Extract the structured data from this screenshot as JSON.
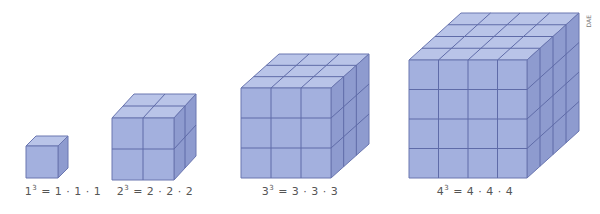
{
  "figure": {
    "credit": "DAE",
    "colors": {
      "front": "#a3b0de",
      "top": "#b9c4e8",
      "side": "#8e9bcf",
      "grid": "#5f6ba8",
      "edge": "#6a76b0"
    },
    "cubes": [
      {
        "n": 1,
        "base": "1",
        "factors": "1 · 1 · 1",
        "x": 26,
        "y": 146,
        "size": 32,
        "dx": 10,
        "dy": 10,
        "label_x": 63
      },
      {
        "n": 2,
        "base": "2",
        "factors": "2 · 2 · 2",
        "x": 112,
        "y": 118,
        "size": 62,
        "dx": 22,
        "dy": 24,
        "label_x": 155
      },
      {
        "n": 3,
        "base": "3",
        "factors": "3 · 3 · 3",
        "x": 241,
        "y": 88,
        "size": 90,
        "dx": 38,
        "dy": 34,
        "label_x": 300
      },
      {
        "n": 4,
        "base": "4",
        "factors": "4 · 4 · 4",
        "x": 409,
        "y": 60,
        "size": 118,
        "dx": 52,
        "dy": 47,
        "label_x": 475
      }
    ]
  }
}
